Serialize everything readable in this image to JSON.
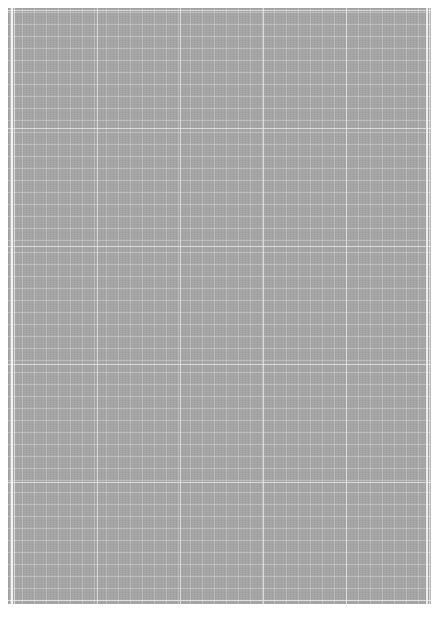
{
  "document": {
    "type": "graph-paper-page",
    "colors": {
      "page_background": "#ffffff",
      "sheet_fill": "#a4a4a4",
      "grid_line": "#d2d2d2",
      "major_grid_line": "#ebebeb",
      "margin_line": "#f4f4f4"
    },
    "grid": {
      "minor_spacing_px": 12,
      "major_spacing_px_x": 83,
      "major_spacing_px_y": 118
    },
    "text": []
  }
}
